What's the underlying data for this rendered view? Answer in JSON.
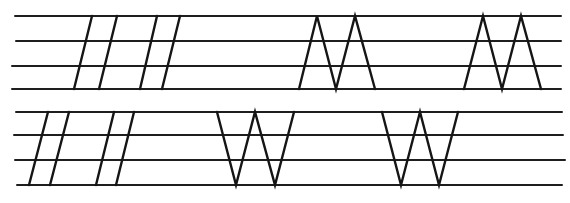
{
  "diagram": {
    "title": "",
    "colors": {
      "background": "#ffffff",
      "line": "#1e1e1e",
      "stroke": "#151515"
    },
    "rows": [
      {
        "name": "upper-row",
        "staff_lines": [
          {
            "x1": 15,
            "x2": 561,
            "y": 16
          },
          {
            "x1": 16,
            "x2": 561,
            "y": 41
          },
          {
            "x1": 12,
            "x2": 561,
            "y": 66
          },
          {
            "x1": 12,
            "x2": 561,
            "y": 89
          }
        ],
        "slanted_strokes": [
          {
            "x1": 92,
            "y1": 16,
            "x2": 74,
            "y2": 89
          },
          {
            "x1": 117,
            "y1": 16,
            "x2": 99,
            "y2": 89
          },
          {
            "x1": 157,
            "y1": 16,
            "x2": 140,
            "y2": 89
          },
          {
            "x1": 180,
            "y1": 16,
            "x2": 162,
            "y2": 89
          }
        ],
        "letter_forms": [
          {
            "name": "m-shape-1",
            "points": [
              [
                299,
                89
              ],
              [
                317,
                16
              ],
              [
                336,
                89
              ],
              [
                355,
                16
              ],
              [
                375,
                89
              ]
            ]
          },
          {
            "name": "m-shape-2",
            "points": [
              [
                464,
                89
              ],
              [
                483,
                16
              ],
              [
                502,
                89
              ],
              [
                521,
                16
              ],
              [
                541,
                89
              ]
            ]
          }
        ]
      },
      {
        "name": "lower-row",
        "staff_lines": [
          {
            "x1": 16,
            "x2": 562,
            "y": 112
          },
          {
            "x1": 14,
            "x2": 563,
            "y": 135
          },
          {
            "x1": 15,
            "x2": 565,
            "y": 160
          },
          {
            "x1": 17,
            "x2": 562,
            "y": 185
          }
        ],
        "slanted_strokes": [
          {
            "x1": 48,
            "y1": 112,
            "x2": 29,
            "y2": 185
          },
          {
            "x1": 69,
            "y1": 112,
            "x2": 50,
            "y2": 185
          },
          {
            "x1": 114,
            "y1": 112,
            "x2": 96,
            "y2": 185
          },
          {
            "x1": 134,
            "y1": 112,
            "x2": 116,
            "y2": 185
          }
        ],
        "letter_forms": [
          {
            "name": "w-shape-1",
            "points": [
              [
                217,
                112
              ],
              [
                236,
                185
              ],
              [
                255,
                112
              ],
              [
                275,
                185
              ],
              [
                294,
                112
              ]
            ]
          },
          {
            "name": "w-shape-2",
            "points": [
              [
                382,
                112
              ],
              [
                401,
                185
              ],
              [
                420,
                112
              ],
              [
                439,
                185
              ],
              [
                458,
                112
              ]
            ]
          }
        ]
      }
    ]
  }
}
